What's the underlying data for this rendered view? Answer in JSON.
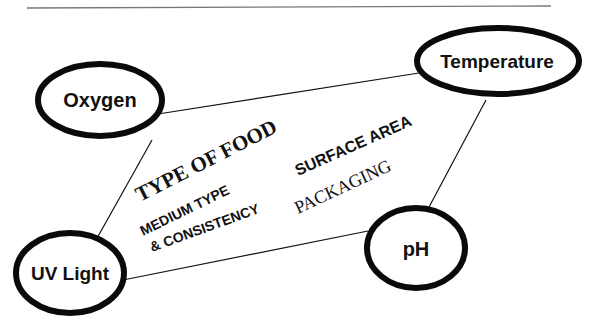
{
  "diagram": {
    "nodes": [
      {
        "id": "oxygen",
        "label": "Oxygen"
      },
      {
        "id": "temperature",
        "label": "Temperature"
      },
      {
        "id": "uv_light",
        "label": "UV Light"
      },
      {
        "id": "ph",
        "label": "pH"
      }
    ],
    "edges": [
      {
        "from": "oxygen",
        "to": "temperature"
      },
      {
        "from": "oxygen",
        "to": "uv_light"
      },
      {
        "from": "temperature",
        "to": "ph"
      },
      {
        "from": "uv_light",
        "to": "ph"
      }
    ],
    "inner_labels": {
      "type_of_food": "TYPE OF FOOD",
      "surface_area": "SURFACE AREA",
      "medium_line1": "MEDIUM TYPE",
      "medium_line2": "& CONSISTENCY",
      "packaging": "PACKAGING"
    }
  }
}
